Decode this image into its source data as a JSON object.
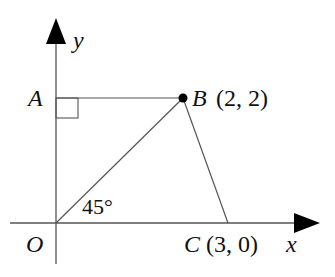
{
  "diagram": {
    "axes": {
      "x_label": "x",
      "y_label": "y",
      "origin_label": "O"
    },
    "points": {
      "A": {
        "name": "A",
        "coords": ""
      },
      "B": {
        "name": "B",
        "coords": "(2, 2)"
      },
      "C": {
        "name": "C",
        "coords": "(3, 0)"
      }
    },
    "angle_label": "45°",
    "colors": {
      "line": "#555555",
      "arrow": "#000000",
      "text": "#111111"
    }
  }
}
